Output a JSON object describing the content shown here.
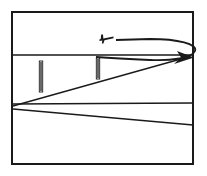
{
  "figure": {
    "background_color": "#ffffff",
    "ink_color": "#1a1a1a"
  },
  "frame": {
    "name": "picture-border",
    "x": 12,
    "y": 12,
    "width": 181,
    "height": 152,
    "stroke_width": 2
  },
  "horizon": {
    "name": "horizon-line",
    "x1": 12,
    "y1": 55,
    "x2": 193,
    "y2": 55,
    "stroke_width": 1.6
  },
  "vertex": {
    "name": "vanishing-point",
    "x": 13,
    "y": 106
  },
  "radiating_lines": [
    {
      "name": "upper-diagonal-line",
      "x1": 13,
      "y1": 106,
      "x2": 188,
      "y2": 57,
      "stroke_width": 1.3
    },
    {
      "name": "middle-horizontal-line",
      "x1": 13,
      "y1": 104,
      "x2": 193,
      "y2": 103,
      "stroke_width": 1.3
    },
    {
      "name": "lower-diagonal-line",
      "x1": 13,
      "y1": 109,
      "x2": 193,
      "y2": 125,
      "stroke_width": 1.3
    }
  ],
  "markers": [
    {
      "name": "marker-post-left",
      "x": 41,
      "y_top": 61,
      "y_bottom": 92,
      "width": 3.4
    },
    {
      "name": "marker-post-right",
      "x": 98,
      "y_top": 58,
      "y_bottom": 79,
      "width": 3.4
    }
  ],
  "flight_path": {
    "name": "curved-flight-arrow",
    "path": "M 116 40 L 150 39 C 178 39 198 44 195 51 C 192 58 172 61 150 60 C 128 59 110 58 96 57",
    "stroke_width": 1.8,
    "arrowhead": {
      "name": "arrowhead",
      "points": "193,58 178,52 181,58 174,63"
    }
  },
  "aircraft": {
    "name": "aircraft-symbol",
    "x": 100,
    "y": 38,
    "body": "M 101 43 L 112 40 L 113 38 L 106 38 L 104 34 L 102 34 L 102 38 L 100 38 Z",
    "wing": "M 102 38 L 105 43 L 100 44 Z"
  }
}
